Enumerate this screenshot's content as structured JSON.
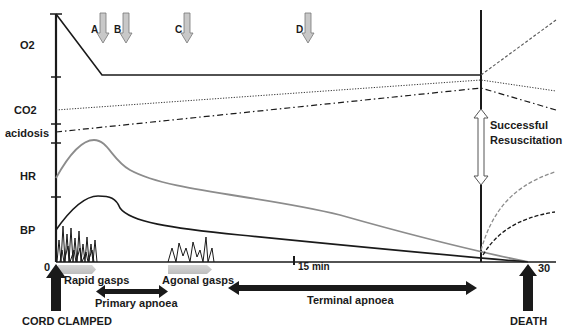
{
  "diagram": {
    "y_labels": {
      "o2": "O2",
      "co2": "CO2",
      "acidosis": "acidosis",
      "hr": "HR",
      "bp": "BP"
    },
    "x_axis": {
      "start": "0",
      "mid": "15 min",
      "end": "30"
    },
    "markers": [
      {
        "id": "A",
        "label": "A"
      },
      {
        "id": "B",
        "label": "B"
      },
      {
        "id": "C",
        "label": "C"
      },
      {
        "id": "D",
        "label": "D"
      }
    ],
    "resuscitation": {
      "line1": "Successful",
      "line2": "Resuscitation"
    },
    "phases": {
      "rapid_gasps": "Rapid gasps",
      "agonal_gasps": "Agonal gasps",
      "primary_apnoea": "Primary apnoea",
      "terminal_apnoea": "Terminal apnoea"
    },
    "events": {
      "cord_clamped": "CORD CLAMPED",
      "death": "DEATH"
    },
    "colors": {
      "line": "#1a1a1a",
      "hr": "#8c8c8c",
      "marker_fill": "#c8c8c8",
      "gasp_bar": "#c8c8c8"
    }
  }
}
